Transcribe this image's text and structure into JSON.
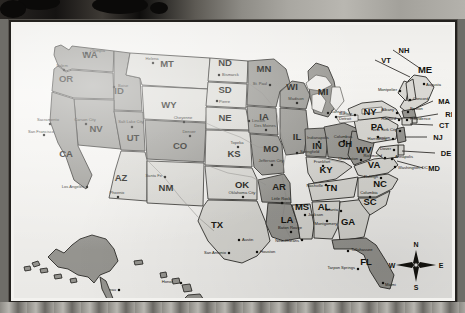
{
  "map": {
    "title": "United States State Map",
    "colors": {
      "fill_dark": "#9b9a95",
      "fill_light": "#dcdbd6",
      "fill_mid": "#bab9b4",
      "outline": "#2e2c29",
      "paper": "#f6f5f2",
      "frame": "#23211e",
      "label": "#15140f"
    },
    "compass": {
      "north": "N",
      "east": "E",
      "south": "S",
      "west": "W"
    },
    "states": [
      {
        "abbr": "WA",
        "x": 76,
        "y": 33,
        "shade": "dark"
      },
      {
        "abbr": "OR",
        "x": 52,
        "y": 57,
        "shade": "dark"
      },
      {
        "abbr": "ID",
        "x": 105,
        "y": 69,
        "shade": "dark"
      },
      {
        "abbr": "MT",
        "x": 153,
        "y": 42,
        "shade": "light"
      },
      {
        "abbr": "WY",
        "x": 155,
        "y": 83,
        "shade": "light"
      },
      {
        "abbr": "NV",
        "x": 82,
        "y": 107,
        "shade": "dark"
      },
      {
        "abbr": "UT",
        "x": 119,
        "y": 116,
        "shade": "dark"
      },
      {
        "abbr": "CO",
        "x": 166,
        "y": 124,
        "shade": "dark"
      },
      {
        "abbr": "CA",
        "x": 52,
        "y": 132,
        "shade": "dark"
      },
      {
        "abbr": "AZ",
        "x": 107,
        "y": 156,
        "shade": "light"
      },
      {
        "abbr": "NM",
        "x": 152,
        "y": 166,
        "shade": "light"
      },
      {
        "abbr": "ND",
        "x": 211,
        "y": 41,
        "shade": "light"
      },
      {
        "abbr": "SD",
        "x": 211,
        "y": 68,
        "shade": "light"
      },
      {
        "abbr": "NE",
        "x": 211,
        "y": 96,
        "shade": "light"
      },
      {
        "abbr": "KS",
        "x": 220,
        "y": 132,
        "shade": "light"
      },
      {
        "abbr": "OK",
        "x": 228,
        "y": 163,
        "shade": "light"
      },
      {
        "abbr": "TX",
        "x": 203,
        "y": 203,
        "shade": "light"
      },
      {
        "abbr": "MN",
        "x": 250,
        "y": 47,
        "shade": "dark"
      },
      {
        "abbr": "IA",
        "x": 250,
        "y": 95,
        "shade": "dark"
      },
      {
        "abbr": "MO",
        "x": 257,
        "y": 127,
        "shade": "dark"
      },
      {
        "abbr": "AR",
        "x": 265,
        "y": 165,
        "shade": "dark"
      },
      {
        "abbr": "LA",
        "x": 273,
        "y": 198,
        "shade": "dark"
      },
      {
        "abbr": "WI",
        "x": 278,
        "y": 65,
        "shade": "dark"
      },
      {
        "abbr": "IL",
        "x": 283,
        "y": 115,
        "shade": "dark"
      },
      {
        "abbr": "MS",
        "x": 288,
        "y": 185,
        "shade": "light"
      },
      {
        "abbr": "MI",
        "x": 309,
        "y": 70,
        "shade": "dark"
      },
      {
        "abbr": "IN",
        "x": 303,
        "y": 124,
        "shade": "dark"
      },
      {
        "abbr": "KY",
        "x": 312,
        "y": 148,
        "shade": "light"
      },
      {
        "abbr": "TN",
        "x": 317,
        "y": 166,
        "shade": "light"
      },
      {
        "abbr": "AL",
        "x": 310,
        "y": 185,
        "shade": "light"
      },
      {
        "abbr": "GA",
        "x": 334,
        "y": 200,
        "shade": "light"
      },
      {
        "abbr": "FL",
        "x": 352,
        "y": 240,
        "shade": "dark"
      },
      {
        "abbr": "OH",
        "x": 331,
        "y": 122,
        "shade": "dark"
      },
      {
        "abbr": "WV",
        "x": 350,
        "y": 128,
        "shade": "dark"
      },
      {
        "abbr": "VA",
        "x": 360,
        "y": 143,
        "shade": "light"
      },
      {
        "abbr": "NC",
        "x": 366,
        "y": 162,
        "shade": "light"
      },
      {
        "abbr": "SC",
        "x": 356,
        "y": 180,
        "shade": "light"
      },
      {
        "abbr": "PA",
        "x": 363,
        "y": 105,
        "shade": "light"
      },
      {
        "abbr": "NY",
        "x": 356,
        "y": 90,
        "shade": "light"
      },
      {
        "abbr": "ME",
        "x": 411,
        "y": 48,
        "shade": "dark"
      },
      {
        "abbr": "AK",
        "x": 78,
        "y": 235,
        "shade": "dark"
      },
      {
        "abbr": "HI",
        "x": 183,
        "y": 281,
        "shade": "dark"
      }
    ],
    "callout_states": [
      {
        "abbr": "NH",
        "lx": 390,
        "ly": 28,
        "tx": 407,
        "ty": 44
      },
      {
        "abbr": "VT",
        "lx": 372,
        "ly": 38,
        "tx": 396,
        "ty": 52
      },
      {
        "abbr": "MA",
        "lx": 430,
        "ly": 79,
        "tx": 398,
        "ty": 85
      },
      {
        "abbr": "RI",
        "lx": 435,
        "ly": 92,
        "tx": 400,
        "ty": 93
      },
      {
        "abbr": "CT",
        "lx": 430,
        "ly": 103,
        "tx": 396,
        "ty": 99
      },
      {
        "abbr": "NJ",
        "lx": 424,
        "ly": 115,
        "tx": 391,
        "ty": 112
      },
      {
        "abbr": "DE",
        "lx": 432,
        "ly": 131,
        "tx": 388,
        "ty": 126
      },
      {
        "abbr": "MD",
        "lx": 420,
        "ly": 146,
        "tx": 383,
        "ty": 136
      }
    ],
    "cities": [
      {
        "name": "Olympia",
        "x": 72,
        "y": 28,
        "dx": 4,
        "dy": -1
      },
      {
        "name": "Salem",
        "x": 50,
        "y": 45,
        "dx": -2,
        "dy": -3,
        "anchor": "middle"
      },
      {
        "name": "Helena",
        "x": 139,
        "y": 38,
        "dx": -1,
        "dy": -3,
        "anchor": "middle"
      },
      {
        "name": "Boise",
        "x": 100,
        "y": 62,
        "dx": 4,
        "dy": 0
      },
      {
        "name": "Bismarck",
        "x": 205,
        "y": 50,
        "dx": 3,
        "dy": 1
      },
      {
        "name": "Pierre",
        "x": 203,
        "y": 76,
        "dx": 2,
        "dy": 2
      },
      {
        "name": "Cheyenne",
        "x": 170,
        "y": 97,
        "dx": -1,
        "dy": -3,
        "anchor": "middle"
      },
      {
        "name": "Denver",
        "x": 176,
        "y": 111,
        "dx": -1,
        "dy": -3,
        "anchor": "middle"
      },
      {
        "name": "Sacramento",
        "x": 36,
        "y": 99,
        "dx": -2,
        "dy": -3,
        "anchor": "middle"
      },
      {
        "name": "San Francisco",
        "x": 30,
        "y": 110,
        "dx": -3,
        "dy": -2,
        "anchor": "middle"
      },
      {
        "name": "Carson City",
        "x": 72,
        "y": 99,
        "dx": -1,
        "dy": -3,
        "anchor": "middle"
      },
      {
        "name": "Salt Lake City",
        "x": 118,
        "y": 102,
        "dx": -1,
        "dy": -4,
        "anchor": "middle"
      },
      {
        "name": "Los Angeles",
        "x": 73,
        "y": 162,
        "dx": -3,
        "dy": 1,
        "anchor": "end"
      },
      {
        "name": "Phoenix",
        "x": 104,
        "y": 172,
        "dx": -1,
        "dy": -3,
        "anchor": "middle"
      },
      {
        "name": "Santa Fe",
        "x": 151,
        "y": 152,
        "dx": -3,
        "dy": 0,
        "anchor": "end"
      },
      {
        "name": "Topeka",
        "x": 224,
        "y": 122,
        "dx": -1,
        "dy": -3,
        "anchor": "middle"
      },
      {
        "name": "Lincoln",
        "x": 235,
        "y": 96,
        "dx": 3,
        "dy": 1
      },
      {
        "name": "St. Paul",
        "x": 256,
        "y": 60,
        "dx": -3,
        "dy": 0,
        "anchor": "end"
      },
      {
        "name": "Des Moines",
        "x": 252,
        "y": 105,
        "dx": -1,
        "dy": -3,
        "anchor": "middle"
      },
      {
        "name": "Madison",
        "x": 283,
        "y": 78,
        "dx": -1,
        "dy": -3,
        "anchor": "middle"
      },
      {
        "name": "Springfield",
        "x": 283,
        "y": 128,
        "dx": 3,
        "dy": 0
      },
      {
        "name": "Jefferson City",
        "x": 258,
        "y": 140,
        "dx": -1,
        "dy": -3,
        "anchor": "middle"
      },
      {
        "name": "Oklahoma City",
        "x": 229,
        "y": 172,
        "dx": -1,
        "dy": -3,
        "anchor": "middle"
      },
      {
        "name": "Little Rock",
        "x": 268,
        "y": 178,
        "dx": -1,
        "dy": -3,
        "anchor": "middle"
      },
      {
        "name": "Jackson",
        "x": 291,
        "y": 190,
        "dx": 3,
        "dy": 1
      },
      {
        "name": "Baton Rouge",
        "x": 277,
        "y": 207,
        "dx": -1,
        "dy": -3,
        "anchor": "middle"
      },
      {
        "name": "New Orleans",
        "x": 288,
        "y": 215,
        "dx": -3,
        "dy": 2,
        "anchor": "end"
      },
      {
        "name": "Austin",
        "x": 225,
        "y": 215,
        "dx": 3,
        "dy": 1
      },
      {
        "name": "San Antonio",
        "x": 215,
        "y": 228,
        "dx": -3,
        "dy": 1,
        "anchor": "end"
      },
      {
        "name": "Houston",
        "x": 243,
        "y": 227,
        "dx": 3,
        "dy": 1
      },
      {
        "name": "Indianapolis",
        "x": 305,
        "y": 117,
        "dx": -1,
        "dy": -3,
        "anchor": "middle"
      },
      {
        "name": "Columbus",
        "x": 330,
        "y": 116,
        "dx": -1,
        "dy": -3,
        "anchor": "middle"
      },
      {
        "name": "Lansing",
        "x": 314,
        "y": 88,
        "dx": 3,
        "dy": 0
      },
      {
        "name": "Detroit",
        "x": 322,
        "y": 92,
        "dx": 3,
        "dy": 3
      },
      {
        "name": "Frankfort",
        "x": 309,
        "y": 141,
        "dx": -1,
        "dy": -3,
        "anchor": "middle"
      },
      {
        "name": "Nashville",
        "x": 312,
        "y": 160,
        "dx": -3,
        "dy": 2,
        "anchor": "end"
      },
      {
        "name": "Montgomery",
        "x": 313,
        "y": 196,
        "dx": -1,
        "dy": 4,
        "anchor": "middle"
      },
      {
        "name": "Atlanta",
        "x": 327,
        "y": 186,
        "dx": -3,
        "dy": 0,
        "anchor": "end"
      },
      {
        "name": "Tallahassee",
        "x": 334,
        "y": 226,
        "dx": 3,
        "dy": 0
      },
      {
        "name": "Tarpon Springs",
        "x": 344,
        "y": 244,
        "dx": -3,
        "dy": 0,
        "anchor": "end"
      },
      {
        "name": "Miami",
        "x": 369,
        "y": 258,
        "dx": 2,
        "dy": 3
      },
      {
        "name": "Columbia",
        "x": 356,
        "y": 172,
        "dx": -1,
        "dy": -3,
        "anchor": "middle"
      },
      {
        "name": "Raleigh",
        "x": 367,
        "y": 153,
        "dx": -3,
        "dy": 0,
        "anchor": "end"
      },
      {
        "name": "Richmond",
        "x": 371,
        "y": 133,
        "dx": -3,
        "dy": -1,
        "anchor": "end"
      },
      {
        "name": "Charleston",
        "x": 347,
        "y": 135,
        "dx": -3,
        "dy": 0,
        "anchor": "end"
      },
      {
        "name": "Washington, DC",
        "x": 381,
        "y": 142,
        "dx": 3,
        "dy": 2
      },
      {
        "name": "Annapolis",
        "x": 378,
        "y": 134,
        "dx": 3,
        "dy": -1
      },
      {
        "name": "Dover",
        "x": 380,
        "y": 125,
        "dx": -3,
        "dy": 0,
        "anchor": "end"
      },
      {
        "name": "Trenton",
        "x": 379,
        "y": 114,
        "dx": -3,
        "dy": 0,
        "anchor": "end"
      },
      {
        "name": "Harrisburg",
        "x": 364,
        "y": 112,
        "dx": -1,
        "dy": 3,
        "anchor": "middle"
      },
      {
        "name": "New York City",
        "x": 386,
        "y": 106,
        "dx": -3,
        "dy": 0,
        "anchor": "end"
      },
      {
        "name": "Providence",
        "x": 393,
        "y": 95,
        "dx": 3,
        "dy": 0
      },
      {
        "name": "Hartford",
        "x": 385,
        "y": 95,
        "dx": -3,
        "dy": 0,
        "anchor": "end"
      },
      {
        "name": "Albany",
        "x": 383,
        "y": 88,
        "dx": -3,
        "dy": -2,
        "anchor": "end"
      },
      {
        "name": "Boston",
        "x": 394,
        "y": 87,
        "dx": 2,
        "dy": -2
      },
      {
        "name": "Concord",
        "x": 396,
        "y": 75,
        "dx": 3,
        "dy": 0
      },
      {
        "name": "Montpelier",
        "x": 386,
        "y": 66,
        "dx": -3,
        "dy": 0,
        "anchor": "end"
      },
      {
        "name": "Augusta",
        "x": 410,
        "y": 59,
        "dx": 2,
        "dy": 2
      },
      {
        "name": "Buffalo",
        "x": 341,
        "y": 90,
        "dx": -3,
        "dy": 0,
        "anchor": "end"
      },
      {
        "name": "Juneau",
        "x": 105,
        "y": 265,
        "dx": -3,
        "dy": 1,
        "anchor": "end"
      },
      {
        "name": "Honolulu",
        "x": 167,
        "y": 258,
        "dx": -3,
        "dy": 0,
        "anchor": "end"
      }
    ]
  }
}
